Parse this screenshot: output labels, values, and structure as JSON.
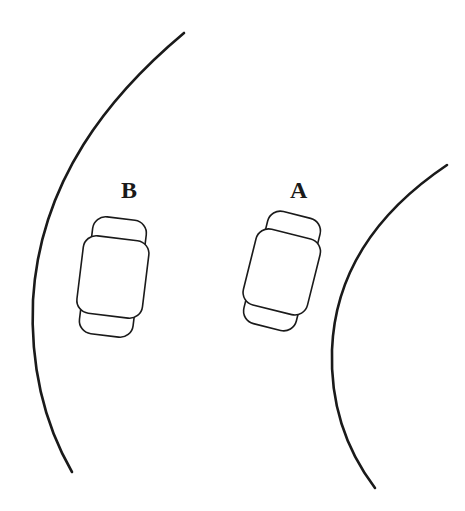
{
  "diagram": {
    "type": "curved-road-with-two-cars",
    "labels": {
      "car_b": "B",
      "car_a": "A"
    },
    "elements": [
      {
        "id": "outer-road-edge",
        "kind": "arc"
      },
      {
        "id": "inner-road-edge",
        "kind": "arc"
      },
      {
        "id": "car-b",
        "label": "B",
        "position": "outer lane"
      },
      {
        "id": "car-a",
        "label": "A",
        "position": "inner lane"
      }
    ],
    "colors": {
      "stroke": "#1a1a1a",
      "background": "#ffffff"
    }
  }
}
